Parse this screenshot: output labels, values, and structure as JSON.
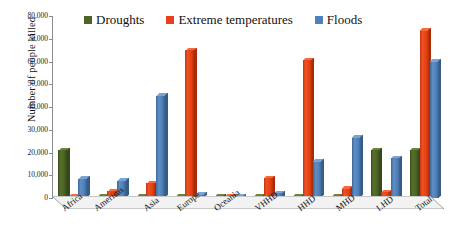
{
  "chart_data": {
    "type": "bar",
    "title": "",
    "xlabel": "",
    "ylabel": "Number of people killed",
    "ylim": [
      0,
      80000
    ],
    "yticks": [
      "0",
      "10,000",
      "20,000",
      "30,000",
      "40,000",
      "50,000",
      "60,000",
      "70,000",
      "80,000"
    ],
    "ytick_values": [
      0,
      10000,
      20000,
      30000,
      40000,
      50000,
      60000,
      70000,
      80000
    ],
    "grid": false,
    "legend_position": "top",
    "categories": [
      "Africa",
      "Americas",
      "Asia",
      "Europe",
      "Oceania",
      "VHHD",
      "HHD",
      "MHD",
      "LHD",
      "Total"
    ],
    "series": [
      {
        "name": "Droughts",
        "color": "#4F6228",
        "values": [
          21000,
          500,
          600,
          200,
          150,
          200,
          300,
          200,
          21000,
          21000
        ]
      },
      {
        "name": "Extreme temperatures",
        "color": "#E8401C",
        "values": [
          700,
          3000,
          6500,
          65000,
          700,
          8700,
          60500,
          4000,
          2500,
          73500
        ]
      },
      {
        "name": "Floods",
        "color": "#4F81BD",
        "values": [
          8500,
          7500,
          45000,
          1500,
          500,
          2000,
          16000,
          26500,
          17500,
          60000
        ]
      }
    ]
  },
  "legend": {
    "items": [
      {
        "label": "Droughts",
        "color": "#4F6228"
      },
      {
        "label": "Extreme temperatures",
        "color": "#E8401C"
      },
      {
        "label": "Floods",
        "color": "#4F81BD"
      }
    ]
  }
}
